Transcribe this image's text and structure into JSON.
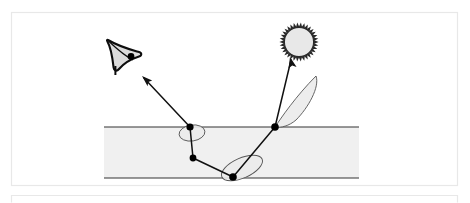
{
  "figure": {
    "background_color": "#ffffff",
    "panel_border_color": "#e8e8e8",
    "stroke_color": "#1a1a1a",
    "slab_fill_color": "#f0f0f0",
    "lobe_fill_color": "#ebebeb",
    "sun_fill_color": "#e8e8e8",
    "eye_fill_color": "#dcdcdc"
  },
  "panels": [
    {
      "name": "main-panel",
      "x": 11,
      "y": 12,
      "width": 447,
      "height": 174
    },
    {
      "name": "next-panel-top-edge",
      "x": 11,
      "y": 195,
      "width": 447,
      "height": 8
    }
  ],
  "slab": {
    "label": "translucent-medium-slab",
    "x": 104,
    "top_y": 127,
    "bottom_y": 178,
    "width": 255,
    "fill": "#f0f0f0",
    "edge_stroke": "#333333"
  },
  "sun": {
    "label": "light-source-sun",
    "cx": 299,
    "cy": 42,
    "radius": 15,
    "ray_count": 34,
    "ray_length": 4.5,
    "fill": "#e8e8e8"
  },
  "eye": {
    "label": "observer-eye",
    "cx": 123,
    "cy": 54,
    "pupil_cx": 131,
    "pupil_cy": 60,
    "pupil_r": 3.2,
    "fill": "#dcdcdc"
  },
  "path": {
    "label": "light-transport-path",
    "points": [
      {
        "name": "sun-arrow-tip",
        "x": 290,
        "y": 58
      },
      {
        "name": "entry-surface-point",
        "x": 275,
        "y": 127
      },
      {
        "name": "interior-vertex",
        "x": 193,
        "y": 158
      },
      {
        "name": "bottom-surface-point",
        "x": 233,
        "y": 177
      },
      {
        "name": "exit-surface-point",
        "x": 190,
        "y": 127
      },
      {
        "name": "eye-arrow-tip",
        "x": 143,
        "y": 77
      }
    ],
    "segments": [
      {
        "name": "sun-to-entry",
        "from": "entry-surface-point",
        "to": "sun-arrow-tip",
        "arrow": true
      },
      {
        "name": "entry-to-bottom",
        "from": "entry-surface-point",
        "to": "bottom-surface-point",
        "arrow": false
      },
      {
        "name": "bottom-to-interior",
        "from": "bottom-surface-point",
        "to": "interior-vertex",
        "arrow": false
      },
      {
        "name": "interior-to-exit",
        "from": "interior-vertex",
        "to": "exit-surface-point",
        "arrow": false
      },
      {
        "name": "exit-to-eye",
        "from": "exit-surface-point",
        "to": "eye-arrow-tip",
        "arrow": true
      }
    ]
  },
  "scatter_points": [
    {
      "name": "scatter-point-exit",
      "x": 190,
      "y": 127,
      "radius": 3.6
    },
    {
      "name": "scatter-point-interior",
      "x": 193,
      "y": 158,
      "radius": 3.4
    },
    {
      "name": "scatter-point-bottom",
      "x": 233,
      "y": 177,
      "radius": 3.8
    },
    {
      "name": "scatter-point-entry",
      "x": 275,
      "y": 127,
      "radius": 3.8
    }
  ],
  "phase_lobes": [
    {
      "name": "phase-lobe-exit",
      "cx": 192,
      "cy": 133,
      "rx": 13,
      "ry": 8,
      "rotation": -8
    },
    {
      "name": "phase-lobe-bottom",
      "cx": 242,
      "cy": 168,
      "rx": 22,
      "ry": 10,
      "rotation": -24
    },
    {
      "name": "phase-lobe-entry-large",
      "cx": 292,
      "cy": 103,
      "rx": 39,
      "ry": 11,
      "rotation": -62
    }
  ],
  "icons": {
    "sun_icon": "sun-icon",
    "eye_icon": "eye-icon",
    "arrow_icon": "arrow-icon",
    "vertex_dot_icon": "dot-icon"
  }
}
